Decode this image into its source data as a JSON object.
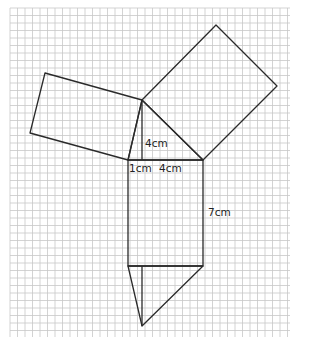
{
  "diagram": {
    "type": "geometric net on squared grid",
    "grid": {
      "x0": 10,
      "y0": 8,
      "x1": 290,
      "y1": 337,
      "step": 7.5,
      "color": "#c8c8c8"
    },
    "line_color": "#2a2a2a",
    "shapes": {
      "left_square": [
        [
          45,
          73
        ],
        [
          142,
          100
        ],
        [
          128,
          160
        ],
        [
          30,
          133
        ]
      ],
      "right_square": [
        [
          142,
          100
        ],
        [
          216,
          25
        ],
        [
          277,
          86
        ],
        [
          203,
          160
        ]
      ],
      "top_triangle": [
        [
          142,
          100
        ],
        [
          128,
          160
        ],
        [
          203,
          160
        ]
      ],
      "altitude": [
        [
          142,
          100
        ],
        [
          142,
          160
        ]
      ],
      "rectangle": [
        [
          128,
          160
        ],
        [
          203,
          160
        ],
        [
          203,
          266
        ],
        [
          128,
          266
        ]
      ],
      "bottom_triangle": [
        [
          128,
          266
        ],
        [
          203,
          266
        ],
        [
          142,
          326
        ]
      ],
      "bottom_altitude": [
        [
          142,
          266
        ],
        [
          142,
          326
        ]
      ]
    },
    "labels": [
      {
        "text": "4cm",
        "x": 145,
        "y": 138
      },
      {
        "text": "1cm",
        "x": 129,
        "y": 163
      },
      {
        "text": "4cm",
        "x": 159,
        "y": 163
      },
      {
        "text": "7cm",
        "x": 208,
        "y": 207
      }
    ]
  }
}
